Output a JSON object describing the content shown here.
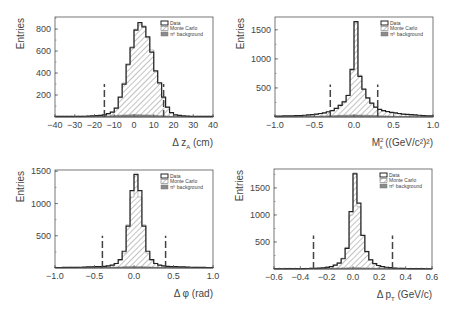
{
  "figure": {
    "layout": "2x2 grid of histograms",
    "colors": {
      "data_line": "#222222",
      "mc_hatch": "#777777",
      "bg_fill": "#8a8a8a",
      "cut_line": "#444444",
      "frame": "#555555"
    }
  },
  "legend": {
    "entries": [
      {
        "label": "Data",
        "style": "open-box-thick"
      },
      {
        "label": "Monte Carlo",
        "style": "hatched"
      },
      {
        "label": "π⁰ background",
        "style": "filled-gray"
      }
    ]
  },
  "chart_data": [
    {
      "type": "bar",
      "id": "dz",
      "title": "",
      "xlabel": "Δ z_A (cm)",
      "xlabel_main": "Δ z",
      "xlabel_sub": "A",
      "xlabel_unit": " (cm)",
      "ylabel": "Entries",
      "xlim": [
        -40,
        40
      ],
      "ylim": [
        0,
        910
      ],
      "xticks": [
        -40,
        -30,
        -20,
        -10,
        0,
        10,
        20,
        30,
        40
      ],
      "yticks": [
        200,
        400,
        600,
        800
      ],
      "cuts": [
        -15,
        15
      ],
      "cut_height": 300,
      "bin_edges": [
        -40,
        -38,
        -36,
        -34,
        -32,
        -30,
        -28,
        -26,
        -24,
        -22,
        -20,
        -18,
        -16,
        -14,
        -12,
        -10,
        -8,
        -6,
        -4,
        -2,
        0,
        2,
        4,
        6,
        8,
        10,
        12,
        14,
        16,
        18,
        20,
        22,
        24,
        26,
        28,
        30,
        32,
        34,
        36,
        38,
        40
      ],
      "series": [
        {
          "name": "Data",
          "values": [
            5,
            5,
            5,
            5,
            5,
            6,
            6,
            7,
            8,
            10,
            12,
            15,
            20,
            30,
            45,
            80,
            180,
            300,
            480,
            630,
            790,
            860,
            820,
            730,
            590,
            420,
            310,
            180,
            90,
            40,
            20,
            14,
            10,
            8,
            6,
            5,
            5,
            5,
            5,
            5
          ]
        },
        {
          "name": "Monte Carlo",
          "values": [
            4,
            4,
            4,
            4,
            5,
            5,
            6,
            7,
            8,
            9,
            11,
            14,
            18,
            28,
            45,
            80,
            175,
            310,
            470,
            640,
            800,
            850,
            830,
            720,
            610,
            410,
            300,
            170,
            85,
            38,
            18,
            12,
            9,
            7,
            5,
            4,
            4,
            4,
            4,
            4
          ]
        },
        {
          "name": "π⁰ background",
          "values": [
            2,
            2,
            2,
            2,
            2,
            3,
            3,
            3,
            4,
            4,
            5,
            6,
            8,
            10,
            12,
            14,
            16,
            18,
            19,
            20,
            20,
            20,
            19,
            18,
            16,
            14,
            12,
            10,
            8,
            6,
            5,
            4,
            3,
            3,
            2,
            2,
            2,
            2,
            2,
            2
          ]
        }
      ]
    },
    {
      "type": "bar",
      "id": "mx2",
      "title": "",
      "xlabel": "M_x^2 ((GeV/c^2)^2)",
      "xlabel_main": "M",
      "xlabel_sub": "x",
      "xlabel_sup": "2",
      "xlabel_unit": " ((GeV/c²)²)",
      "ylabel": "Entries",
      "xlim": [
        -1.0,
        1.0
      ],
      "ylim": [
        0,
        1720
      ],
      "xticks": [
        -1.0,
        -0.5,
        0.0,
        0.5,
        1.0
      ],
      "yticks": [
        500,
        1000,
        1500
      ],
      "cuts": [
        -0.3,
        0.3
      ],
      "cut_height": 560,
      "bin_edges": [
        -1.0,
        -0.95,
        -0.9,
        -0.85,
        -0.8,
        -0.75,
        -0.7,
        -0.65,
        -0.6,
        -0.55,
        -0.5,
        -0.45,
        -0.4,
        -0.35,
        -0.3,
        -0.25,
        -0.2,
        -0.15,
        -0.1,
        -0.05,
        0.0,
        0.05,
        0.1,
        0.15,
        0.2,
        0.25,
        0.3,
        0.35,
        0.4,
        0.45,
        0.5,
        0.55,
        0.6,
        0.65,
        0.7,
        0.75,
        0.8,
        0.85,
        0.9,
        0.95,
        1.0
      ],
      "series": [
        {
          "name": "Data",
          "values": [
            15,
            15,
            18,
            18,
            20,
            22,
            25,
            30,
            35,
            40,
            50,
            60,
            70,
            90,
            110,
            150,
            200,
            260,
            370,
            820,
            1640,
            700,
            480,
            330,
            240,
            170,
            130,
            110,
            95,
            80,
            70,
            60,
            50,
            45,
            40,
            35,
            30,
            25,
            20,
            18
          ]
        },
        {
          "name": "Monte Carlo",
          "values": [
            10,
            10,
            12,
            12,
            14,
            16,
            18,
            22,
            28,
            35,
            45,
            55,
            65,
            85,
            110,
            150,
            205,
            270,
            380,
            800,
            1620,
            720,
            470,
            320,
            230,
            165,
            125,
            100,
            85,
            70,
            60,
            50,
            42,
            36,
            30,
            26,
            22,
            18,
            15,
            12
          ]
        },
        {
          "name": "π⁰ background",
          "values": [
            5,
            5,
            6,
            6,
            7,
            8,
            9,
            10,
            11,
            12,
            14,
            16,
            18,
            20,
            22,
            25,
            28,
            30,
            32,
            34,
            34,
            33,
            31,
            29,
            27,
            24,
            21,
            18,
            16,
            14,
            12,
            10,
            9,
            8,
            7,
            6,
            6,
            5,
            5,
            5
          ]
        }
      ]
    },
    {
      "type": "bar",
      "id": "dphi",
      "title": "",
      "xlabel": "Δ φ (rad)",
      "xlabel_main": "Δ φ",
      "xlabel_unit": " (rad)",
      "ylabel": "Entries",
      "xlim": [
        -1.0,
        1.0
      ],
      "ylim": [
        0,
        1520
      ],
      "xticks": [
        -1.0,
        -0.5,
        0.0,
        0.5,
        1.0
      ],
      "yticks": [
        500,
        1000,
        1500
      ],
      "cuts": [
        -0.4,
        0.4
      ],
      "cut_height": 500,
      "bin_edges": [
        -1.0,
        -0.95,
        -0.9,
        -0.85,
        -0.8,
        -0.75,
        -0.7,
        -0.65,
        -0.6,
        -0.55,
        -0.5,
        -0.45,
        -0.4,
        -0.35,
        -0.3,
        -0.25,
        -0.2,
        -0.15,
        -0.1,
        -0.05,
        0.0,
        0.05,
        0.1,
        0.15,
        0.2,
        0.25,
        0.3,
        0.35,
        0.4,
        0.45,
        0.5,
        0.55,
        0.6,
        0.65,
        0.7,
        0.75,
        0.8,
        0.85,
        0.9,
        0.95,
        1.0
      ],
      "series": [
        {
          "name": "Data",
          "values": [
            8,
            8,
            9,
            10,
            10,
            11,
            12,
            14,
            16,
            18,
            20,
            22,
            26,
            32,
            45,
            70,
            130,
            260,
            650,
            1200,
            1450,
            1200,
            650,
            260,
            130,
            70,
            45,
            32,
            26,
            22,
            20,
            18,
            16,
            14,
            12,
            11,
            10,
            9,
            8,
            8
          ]
        },
        {
          "name": "Monte Carlo",
          "values": [
            6,
            6,
            7,
            8,
            8,
            9,
            10,
            12,
            14,
            16,
            18,
            20,
            24,
            30,
            42,
            72,
            120,
            230,
            670,
            1100,
            1470,
            1100,
            670,
            230,
            120,
            72,
            42,
            30,
            24,
            20,
            18,
            16,
            14,
            12,
            10,
            9,
            8,
            7,
            6,
            6
          ]
        },
        {
          "name": "π⁰ background",
          "values": [
            3,
            3,
            3,
            4,
            4,
            4,
            5,
            5,
            6,
            6,
            7,
            8,
            9,
            10,
            12,
            14,
            16,
            18,
            20,
            21,
            21,
            20,
            18,
            16,
            14,
            12,
            10,
            9,
            8,
            7,
            6,
            6,
            5,
            5,
            4,
            4,
            4,
            3,
            3,
            3
          ]
        }
      ]
    },
    {
      "type": "bar",
      "id": "dpt",
      "title": "",
      "xlabel": "Δ p_T (GeV/c)",
      "xlabel_main": "Δ p",
      "xlabel_sub": "T",
      "xlabel_unit": " (GeV/c)",
      "ylabel": "Entries",
      "xlim": [
        -0.6,
        0.6
      ],
      "ylim": [
        0,
        1850
      ],
      "xticks": [
        -0.6,
        -0.4,
        -0.2,
        0.0,
        0.2,
        0.4,
        0.6
      ],
      "yticks": [
        500,
        1000,
        1500
      ],
      "cuts": [
        -0.3,
        0.3
      ],
      "cut_height": 620,
      "bin_edges": [
        -0.6,
        -0.57,
        -0.54,
        -0.51,
        -0.48,
        -0.45,
        -0.42,
        -0.39,
        -0.36,
        -0.33,
        -0.3,
        -0.27,
        -0.24,
        -0.21,
        -0.18,
        -0.15,
        -0.12,
        -0.09,
        -0.06,
        -0.03,
        0.0,
        0.03,
        0.06,
        0.09,
        0.12,
        0.15,
        0.18,
        0.21,
        0.24,
        0.27,
        0.3,
        0.33,
        0.36,
        0.39,
        0.42,
        0.45,
        0.48,
        0.51,
        0.54,
        0.57,
        0.6
      ],
      "series": [
        {
          "name": "Data",
          "values": [
            5,
            5,
            5,
            6,
            6,
            6,
            7,
            8,
            9,
            10,
            12,
            15,
            20,
            30,
            45,
            70,
            110,
            190,
            380,
            1060,
            1760,
            1220,
            620,
            320,
            170,
            100,
            65,
            45,
            32,
            24,
            18,
            14,
            11,
            9,
            8,
            7,
            6,
            6,
            5,
            5
          ]
        },
        {
          "name": "Monte Carlo",
          "values": [
            4,
            4,
            4,
            5,
            5,
            5,
            6,
            7,
            8,
            9,
            11,
            14,
            19,
            28,
            44,
            72,
            115,
            200,
            400,
            1000,
            1780,
            1150,
            640,
            330,
            175,
            105,
            66,
            44,
            30,
            22,
            16,
            12,
            10,
            8,
            7,
            6,
            5,
            5,
            4,
            4
          ]
        },
        {
          "name": "π⁰ background",
          "values": [
            2,
            2,
            2,
            2,
            3,
            3,
            3,
            4,
            4,
            5,
            6,
            7,
            8,
            10,
            12,
            14,
            16,
            18,
            20,
            22,
            22,
            21,
            19,
            17,
            15,
            13,
            11,
            9,
            8,
            7,
            6,
            5,
            4,
            4,
            3,
            3,
            3,
            2,
            2,
            2
          ]
        }
      ]
    }
  ],
  "panels": [
    {
      "ylabel": "Entries",
      "xlabel": "Δ z_A (cm)"
    },
    {
      "ylabel": "Entries",
      "xlabel": "M_x^2 ((GeV/c^2)^2)"
    },
    {
      "ylabel": "Entries",
      "xlabel": "Δ φ (rad)"
    },
    {
      "ylabel": "Entries",
      "xlabel": "Δ p_T (GeV/c)"
    }
  ]
}
